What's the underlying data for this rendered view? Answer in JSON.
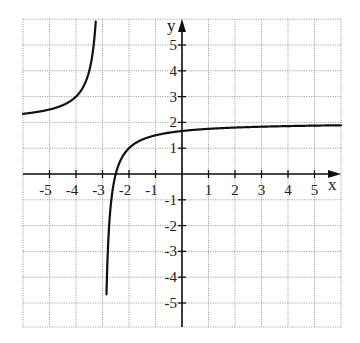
{
  "chart_data": {
    "type": "line",
    "title": "",
    "xlabel": "x",
    "ylabel": "y",
    "xlim": [
      -6,
      6
    ],
    "ylim": [
      -6,
      6
    ],
    "grid": true,
    "grid_style": "dotted",
    "x_ticks": [
      -5,
      -4,
      -3,
      -2,
      -1,
      1,
      2,
      3,
      4,
      5
    ],
    "y_ticks": [
      5,
      4,
      3,
      2,
      1,
      -1,
      -2,
      -3,
      -4,
      -5
    ],
    "x_tick_labels": [
      "-5",
      "-4",
      "-3",
      "-2",
      "-1",
      "1",
      "2",
      "3",
      "4",
      "5"
    ],
    "y_tick_labels": [
      "5",
      "4",
      "3",
      "2",
      "1",
      "-1",
      "-2",
      "-3",
      "-4",
      "-5"
    ],
    "function": "y = 2 - 1/(x + 3)",
    "vertical_asymptote": -3,
    "horizontal_asymptote": 2,
    "series": [
      {
        "name": "left branch",
        "x": [
          -6,
          -5,
          -4.5,
          -4,
          -3.6,
          -3.4,
          -3.25
        ],
        "y": [
          2.33,
          2.5,
          2.67,
          3,
          3.67,
          4.5,
          6
        ]
      },
      {
        "name": "right branch",
        "x": [
          -2.83,
          -2.75,
          -2.6,
          -2.5,
          -2.25,
          -2,
          -1,
          0,
          1,
          2,
          3,
          4,
          5,
          6
        ],
        "y": [
          -4,
          -2,
          -0.5,
          0,
          0.67,
          1,
          1.5,
          1.67,
          1.75,
          1.8,
          1.83,
          1.86,
          1.88,
          1.89
        ]
      }
    ],
    "colors": {
      "curve": "#111111",
      "axis": "#111111",
      "grid": "#9a9a9a"
    }
  },
  "labels": {
    "x_axis": "x",
    "y_axis": "y"
  }
}
